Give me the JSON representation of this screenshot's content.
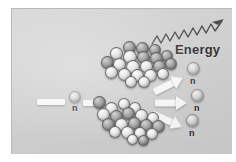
{
  "figure": {
    "background_color": "#ffffff",
    "panel_color": "#d0d0d0",
    "panel_border_color": "#b9b9b9",
    "arrow_color": "#fdfdfd",
    "label_color": "#1d1d1d"
  },
  "labels": {
    "incoming_neutron": "n",
    "emitted_neutron_1": "n",
    "emitted_neutron_2": "n",
    "emitted_neutron_3": "n",
    "energy": "Energy"
  },
  "particles": {
    "incoming_neutron": {
      "label": "n",
      "x": 68,
      "y": 88,
      "d": 11
    },
    "emitted_neutrons": [
      {
        "label": "n",
        "x": 186,
        "y": 62,
        "d": 12
      },
      {
        "label": "n",
        "x": 189,
        "y": 88,
        "d": 12
      },
      {
        "label": "n",
        "x": 186,
        "y": 112,
        "d": 12
      }
    ]
  },
  "fragments": {
    "upper": {
      "name": "upper-fission-fragment",
      "nucleon_count": 21
    },
    "lower": {
      "name": "lower-fission-fragment",
      "nucleon_count": 20
    }
  },
  "arrows": {
    "incoming_left": {
      "name": "incoming-neutron-arrow-left"
    },
    "incoming_right": {
      "name": "incoming-neutron-arrow-right"
    },
    "emission": [
      {
        "name": "neutron-emission-arrow-top"
      },
      {
        "name": "neutron-emission-arrow-middle"
      },
      {
        "name": "neutron-emission-arrow-bottom"
      }
    ],
    "gamma": {
      "name": "energy-gamma-wave-arrow",
      "style": "zigzag"
    }
  },
  "nucleons": {
    "upper": [
      {
        "x": 24,
        "y": 0,
        "d": 13,
        "t": "dark"
      },
      {
        "x": 37,
        "y": 1,
        "d": 13,
        "t": "dark"
      },
      {
        "x": 50,
        "y": 3,
        "d": 12,
        "t": "dark"
      },
      {
        "x": 11,
        "y": 6,
        "d": 13,
        "t": "light"
      },
      {
        "x": 24,
        "y": 9,
        "d": 14,
        "t": "light"
      },
      {
        "x": 38,
        "y": 10,
        "d": 13,
        "t": "dark"
      },
      {
        "x": 51,
        "y": 11,
        "d": 13,
        "t": "dark"
      },
      {
        "x": 62,
        "y": 9,
        "d": 12,
        "t": "dark"
      },
      {
        "x": 2,
        "y": 15,
        "d": 13,
        "t": "dark"
      },
      {
        "x": 14,
        "y": 17,
        "d": 13,
        "t": "light"
      },
      {
        "x": 27,
        "y": 19,
        "d": 14,
        "t": "light"
      },
      {
        "x": 41,
        "y": 19,
        "d": 13,
        "t": "light"
      },
      {
        "x": 54,
        "y": 19,
        "d": 13,
        "t": "dark"
      },
      {
        "x": 66,
        "y": 17,
        "d": 12,
        "t": "dark"
      },
      {
        "x": 6,
        "y": 25,
        "d": 13,
        "t": "light"
      },
      {
        "x": 19,
        "y": 27,
        "d": 13,
        "t": "light"
      },
      {
        "x": 32,
        "y": 28,
        "d": 13,
        "t": "light"
      },
      {
        "x": 45,
        "y": 28,
        "d": 13,
        "t": "light"
      },
      {
        "x": 58,
        "y": 27,
        "d": 12,
        "t": "light"
      },
      {
        "x": 26,
        "y": 35,
        "d": 12,
        "t": "light"
      },
      {
        "x": 39,
        "y": 35,
        "d": 12,
        "t": "light"
      }
    ],
    "lower": [
      {
        "x": 2,
        "y": 4,
        "d": 13,
        "t": "dark"
      },
      {
        "x": 14,
        "y": 10,
        "d": 13,
        "t": "light"
      },
      {
        "x": 27,
        "y": 6,
        "d": 12,
        "t": "light"
      },
      {
        "x": 38,
        "y": 10,
        "d": 12,
        "t": "light"
      },
      {
        "x": 6,
        "y": 16,
        "d": 13,
        "t": "light"
      },
      {
        "x": 19,
        "y": 18,
        "d": 13,
        "t": "dark"
      },
      {
        "x": 31,
        "y": 15,
        "d": 13,
        "t": "dark"
      },
      {
        "x": 44,
        "y": 17,
        "d": 13,
        "t": "light"
      },
      {
        "x": 56,
        "y": 20,
        "d": 12,
        "t": "light"
      },
      {
        "x": 11,
        "y": 26,
        "d": 13,
        "t": "dark"
      },
      {
        "x": 24,
        "y": 26,
        "d": 13,
        "t": "light"
      },
      {
        "x": 37,
        "y": 25,
        "d": 13,
        "t": "dark"
      },
      {
        "x": 49,
        "y": 27,
        "d": 13,
        "t": "dark"
      },
      {
        "x": 61,
        "y": 28,
        "d": 13,
        "t": "dark"
      },
      {
        "x": 18,
        "y": 34,
        "d": 12,
        "t": "light"
      },
      {
        "x": 30,
        "y": 34,
        "d": 13,
        "t": "light"
      },
      {
        "x": 43,
        "y": 35,
        "d": 12,
        "t": "light"
      },
      {
        "x": 55,
        "y": 36,
        "d": 12,
        "t": "light"
      },
      {
        "x": 36,
        "y": 42,
        "d": 11,
        "t": "light"
      },
      {
        "x": 47,
        "y": 43,
        "d": 11,
        "t": "dark"
      }
    ]
  }
}
